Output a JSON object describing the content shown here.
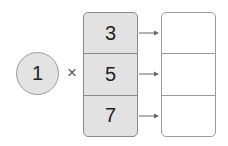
{
  "diagram": {
    "type": "multiplication-map",
    "multiplier": "1",
    "operator": "×",
    "inputs": [
      "3",
      "5",
      "7"
    ],
    "outputs": [
      "",
      "",
      ""
    ],
    "colors": {
      "circle_fill": "#e3e3e3",
      "input_fill": "#e2e2e2",
      "output_fill": "#ffffff",
      "border": "#8a8a8a",
      "arrow": "#666666"
    }
  }
}
